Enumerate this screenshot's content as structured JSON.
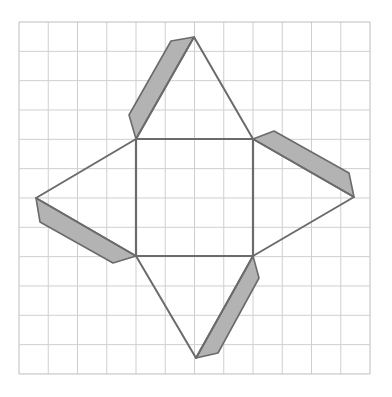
{
  "diagram": {
    "grid": {
      "x0": 19,
      "y0": 22,
      "cols": 12,
      "rows": 12,
      "cell_w": 29.25,
      "cell_h": 29.33,
      "line_color": "#cfcfcf",
      "border_color": "#bdbdbd"
    },
    "colors": {
      "stroke": "#6b6b6b",
      "tab_fill": "#b3b3b3",
      "background": "#ffffff"
    },
    "square_base": {
      "points": [
        [
          136,
          139
        ],
        [
          253,
          139
        ],
        [
          253,
          256
        ],
        [
          136,
          256
        ]
      ]
    },
    "triangles": [
      {
        "name": "top-face",
        "points": [
          [
            136,
            139
          ],
          [
            194,
            37
          ],
          [
            253,
            139
          ]
        ]
      },
      {
        "name": "right-face",
        "points": [
          [
            253,
            139
          ],
          [
            354,
            197
          ],
          [
            253,
            256
          ]
        ]
      },
      {
        "name": "bottom-face",
        "points": [
          [
            253,
            256
          ],
          [
            196,
            358
          ],
          [
            136,
            256
          ]
        ]
      },
      {
        "name": "left-face",
        "points": [
          [
            136,
            256
          ],
          [
            36,
            198
          ],
          [
            136,
            139
          ]
        ]
      }
    ],
    "tabs": [
      {
        "name": "top-tab",
        "points": [
          [
            194,
            37
          ],
          [
            171,
            41
          ],
          [
            129,
            115
          ],
          [
            136,
            139
          ]
        ]
      },
      {
        "name": "right-tab",
        "points": [
          [
            253,
            139
          ],
          [
            274,
            131
          ],
          [
            349,
            173
          ],
          [
            354,
            197
          ]
        ]
      },
      {
        "name": "bottom-tab",
        "points": [
          [
            253,
            256
          ],
          [
            259,
            278
          ],
          [
            218,
            353
          ],
          [
            196,
            358
          ]
        ]
      },
      {
        "name": "left-tab",
        "points": [
          [
            36,
            198
          ],
          [
            40,
            222
          ],
          [
            113,
            263
          ],
          [
            136,
            256
          ]
        ]
      }
    ]
  }
}
